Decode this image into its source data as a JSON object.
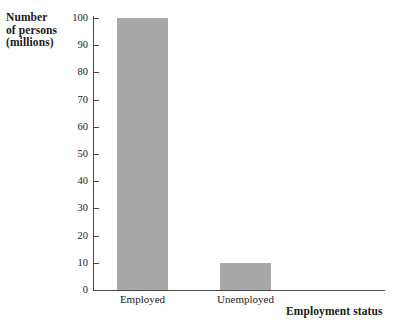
{
  "chart_data": {
    "type": "bar",
    "title": "",
    "categories": [
      "Employed",
      "Unemployed"
    ],
    "values": [
      100,
      10
    ],
    "xlabel": "Employment status",
    "ylabel": "Number of persons (millions)",
    "ylabel_lines": [
      "Number",
      "of persons",
      "(millions)"
    ],
    "ylim": [
      0,
      100
    ],
    "ytick_labels": [
      "0",
      "10",
      "20",
      "30",
      "40",
      "50",
      "60",
      "70",
      "80",
      "90",
      "100"
    ],
    "ytick_values": [
      0,
      10,
      20,
      30,
      40,
      50,
      60,
      70,
      80,
      90,
      100
    ],
    "grid": false,
    "legend": false,
    "bar_color": "#a8a8a8",
    "axis_color": "#4a4a4a",
    "text_color": "#1a1a1a",
    "background_color": "#ffffff"
  }
}
